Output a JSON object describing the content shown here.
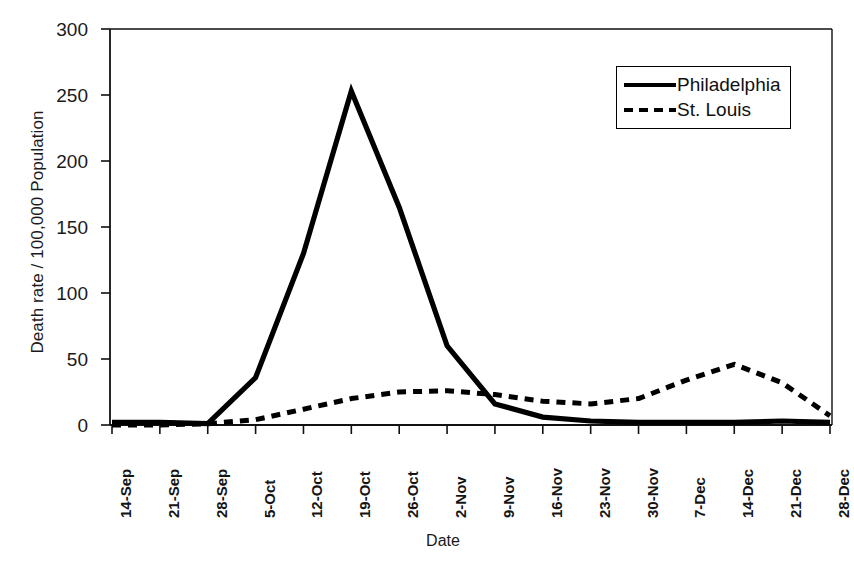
{
  "chart_data": {
    "type": "line",
    "title": "",
    "xlabel": "Date",
    "ylabel": "Death rate / 100,000 Population",
    "categories": [
      "14-Sep",
      "21-Sep",
      "28-Sep",
      "5-Oct",
      "12-Oct",
      "19-Oct",
      "26-Oct",
      "2-Nov",
      "9-Nov",
      "16-Nov",
      "23-Nov",
      "30-Nov",
      "7-Dec",
      "14-Dec",
      "21-Dec",
      "28-Dec"
    ],
    "ylim": [
      0,
      300
    ],
    "yticks": [
      0,
      50,
      100,
      150,
      200,
      250,
      300
    ],
    "grid": false,
    "legend_position": "upper right",
    "series": [
      {
        "name": "Philadelphia",
        "style": "solid",
        "color": "#000000",
        "values": [
          2,
          2,
          1,
          36,
          130,
          253,
          165,
          60,
          16,
          6,
          3,
          2,
          2,
          2,
          3,
          2
        ]
      },
      {
        "name": "St. Louis",
        "style": "dashed",
        "color": "#000000",
        "values": [
          0,
          0,
          1,
          4,
          12,
          20,
          25,
          26,
          23,
          18,
          16,
          20,
          34,
          46,
          32,
          7
        ]
      }
    ]
  },
  "axes": {
    "y_tick_labels": [
      "300",
      "250",
      "200",
      "150",
      "100",
      "50",
      "0"
    ],
    "x_tick_labels": [
      "14-Sep",
      "21-Sep",
      "28-Sep",
      "5-Oct",
      "12-Oct",
      "19-Oct",
      "26-Oct",
      "2-Nov",
      "9-Nov",
      "16-Nov",
      "23-Nov",
      "30-Nov",
      "7-Dec",
      "14-Dec",
      "21-Dec",
      "28-Dec"
    ],
    "y_axis_title": "Death rate / 100,000 Population",
    "x_axis_title": "Date"
  },
  "legend": {
    "entries": [
      {
        "label": "Philadelphia",
        "style": "solid"
      },
      {
        "label": "St. Louis",
        "style": "dashed"
      }
    ]
  }
}
